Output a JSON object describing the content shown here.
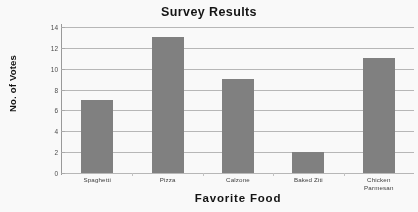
{
  "chart_data": {
    "type": "bar",
    "title": "Survey Results",
    "xlabel": "Favorite  Food",
    "ylabel": "No. of Votes",
    "categories": [
      "Spaghetti",
      "Pizza",
      "Calzone",
      "Baked Ziti",
      "Chicken Parmesan"
    ],
    "category_lines": [
      [
        "Spaghetti"
      ],
      [
        "Pizza"
      ],
      [
        "Calzone"
      ],
      [
        "Baked Ziti"
      ],
      [
        "Chicken",
        "Parmesan"
      ]
    ],
    "values": [
      7,
      13,
      9,
      2,
      11
    ],
    "ylim": [
      0,
      14
    ],
    "ytick_step": 2,
    "yticks": [
      14,
      12,
      10,
      8,
      6,
      4,
      2,
      0
    ],
    "grid": true,
    "legend": "none",
    "bar_color": "#808080",
    "gridline_color": "#b9b9b9",
    "background_color": "#fdfdfd",
    "text_color": "#111111"
  }
}
